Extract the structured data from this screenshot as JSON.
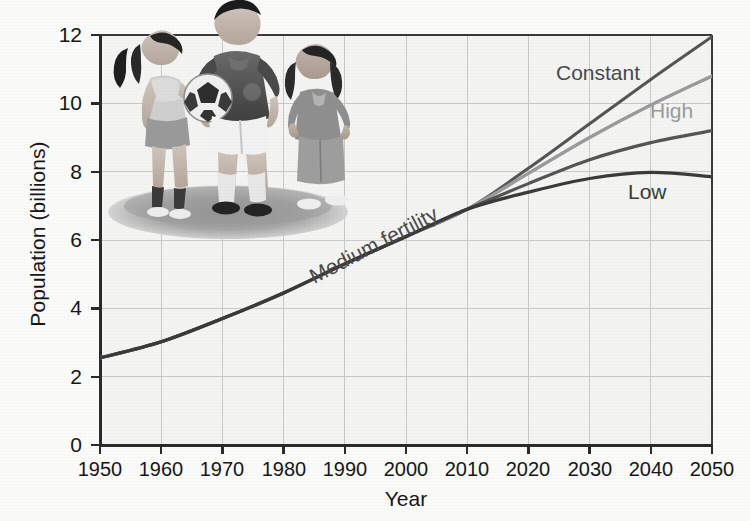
{
  "figure": {
    "kind": "scientific-figure-scan",
    "background_color": "#fbfbfa",
    "plot_background_color": "#f4f4f3",
    "grid_color": "#c9c9c9",
    "axis_color": "#2b2b2b"
  },
  "axes": {
    "y_title": "Population (billions)",
    "x_title": "Year",
    "y_ticks": [
      "0",
      "2",
      "4",
      "6",
      "8",
      "10",
      "12"
    ],
    "x_ticks": [
      "1950",
      "1960",
      "1970",
      "1980",
      "1990",
      "2000",
      "2010",
      "2020",
      "2030",
      "2040",
      "2050"
    ]
  },
  "annotations": {
    "constant": "Constant",
    "high": "High",
    "low": "Low",
    "medium": "Medium fertility"
  },
  "photo": {
    "caption_alt": "three children standing on a grassy mound, center boy holding a soccer ball",
    "subjects": [
      "girl-with-ponytail",
      "boy-with-soccer-ball",
      "girl-running"
    ]
  },
  "chart_data": {
    "type": "line",
    "title": "",
    "xlabel": "Year",
    "ylabel": "Population (billions)",
    "xlim": [
      1950,
      2050
    ],
    "ylim": [
      0,
      12
    ],
    "xticks": [
      1950,
      1960,
      1970,
      1980,
      1990,
      2000,
      2010,
      2020,
      2030,
      2040,
      2050
    ],
    "yticks": [
      0,
      2,
      4,
      6,
      8,
      10,
      12
    ],
    "grid": true,
    "legend": "inline-labels",
    "divergence_year": 2010,
    "divergence_value": 6.9,
    "x": [
      1950,
      1960,
      1970,
      1980,
      1990,
      2000,
      2010,
      2020,
      2030,
      2040,
      2050
    ],
    "series": [
      {
        "name": "Constant",
        "color": "#555555",
        "label_position": "upper-right",
        "values": [
          2.55,
          3.02,
          3.7,
          4.45,
          5.3,
          6.1,
          6.9,
          8.1,
          9.4,
          10.7,
          11.95
        ]
      },
      {
        "name": "High",
        "color": "#9b9b9b",
        "label_position": "right",
        "values": [
          2.55,
          3.02,
          3.7,
          4.45,
          5.3,
          6.1,
          6.9,
          7.95,
          9.0,
          9.95,
          10.8
        ]
      },
      {
        "name": "Medium fertility",
        "color": "#555555",
        "label_position": "along-curve",
        "values": [
          2.55,
          3.02,
          3.7,
          4.45,
          5.3,
          6.1,
          6.9,
          7.65,
          8.35,
          8.85,
          9.2
        ]
      },
      {
        "name": "Low",
        "color": "#3a3a3a",
        "label_position": "lower-right",
        "values": [
          2.55,
          3.02,
          3.7,
          4.45,
          5.3,
          6.1,
          6.9,
          7.4,
          7.8,
          7.98,
          7.85
        ]
      }
    ],
    "historical_range": [
      1950,
      2010
    ],
    "projection_range": [
      2010,
      2050
    ]
  }
}
